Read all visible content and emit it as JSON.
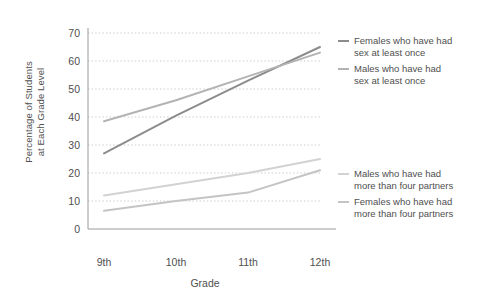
{
  "chart_data": {
    "type": "line",
    "title": "",
    "xlabel": "Grade",
    "ylabel": "Percentage of Students\nat Each Grade Level",
    "categories": [
      "9th",
      "10th",
      "11th",
      "12th"
    ],
    "x_tick_labels": [
      "9th",
      "10th",
      "11th",
      "12th"
    ],
    "y_tick_labels": [
      "0",
      "10",
      "20",
      "30",
      "40",
      "50",
      "60",
      "70"
    ],
    "y_ticks": [
      0,
      10,
      20,
      30,
      40,
      50,
      60,
      70
    ],
    "ylim": [
      0,
      70
    ],
    "grid": true,
    "grid_style": "dotted-horizontal",
    "legend_position": "right",
    "series": [
      {
        "name": "Females who have had\nsex at least once",
        "color": "#8c8c8c",
        "values": [
          27,
          40.5,
          53,
          65
        ]
      },
      {
        "name": "Males who have had\nsex at least once",
        "color": "#b3b3b3",
        "values": [
          38.5,
          46,
          54.5,
          63
        ]
      },
      {
        "name": "Males who have had\nmore than four partners",
        "color": "#d2d2d2",
        "values": [
          12,
          16,
          20,
          25
        ]
      },
      {
        "name": "Females who have had\nmore than four partners",
        "color": "#c4c4c4",
        "values": [
          6.5,
          10,
          13,
          21
        ]
      }
    ]
  },
  "axes": {
    "y_title": "Percentage of Students\nat Each Grade Level",
    "x_title": "Grade"
  },
  "legend": {
    "entries": [
      {
        "label": "Females who have had\nsex at least once",
        "color": "#8c8c8c"
      },
      {
        "label": "Males who have had\nsex at least once",
        "color": "#b3b3b3"
      },
      {
        "label": "Males who have had\nmore than four partners",
        "color": "#d2d2d2"
      },
      {
        "label": "Females who have had\nmore than four partners",
        "color": "#c4c4c4"
      }
    ]
  },
  "style": {
    "axis_color": "#9a9a9a",
    "grid_color": "#c9c9d6",
    "text_color": "#4f4f4f",
    "background": "#ffffff"
  }
}
